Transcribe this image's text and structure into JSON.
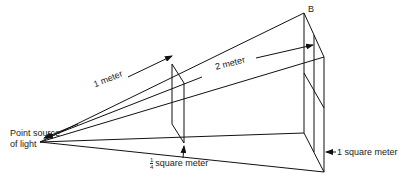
{
  "diagram": {
    "labels": {
      "source": [
        "Point source",
        "of light"
      ],
      "distance1": "1 meter",
      "distance2": "2 meter",
      "small_area_num": "1",
      "small_area_den": "4",
      "small_area_text": "square meter",
      "large_area": "1 square meter",
      "corner": "B"
    },
    "colors": {
      "line": "#111111",
      "background": "#ffffff",
      "text": "#222222"
    },
    "geometry": {
      "source": [
        40,
        142
      ],
      "small_square": {
        "tl": [
          172,
          64
        ],
        "tr": [
          184,
          83
        ],
        "bl": [
          172,
          124
        ],
        "br": [
          184,
          143
        ]
      },
      "large_square": {
        "tl": [
          304,
          13
        ],
        "tr": [
          324,
          57
        ],
        "bl": [
          304,
          133
        ],
        "br": [
          324,
          172
        ]
      }
    }
  }
}
